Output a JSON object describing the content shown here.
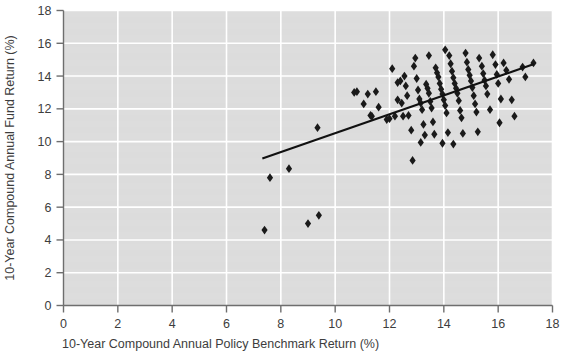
{
  "chart_data": {
    "type": "scatter",
    "title": "",
    "xlabel": "10-Year Compound Annual Policy Benchmark Return (%)",
    "ylabel": "10-Year Compound Annual Fund Return (%)",
    "xlim": [
      0,
      18
    ],
    "ylim": [
      0,
      18
    ],
    "xticks": [
      0,
      2,
      4,
      6,
      8,
      10,
      12,
      14,
      16,
      18
    ],
    "yticks": [
      0,
      2,
      4,
      6,
      8,
      10,
      12,
      14,
      16,
      18
    ],
    "grid": true,
    "legend": null,
    "marker": "diamond",
    "marker_color": "#1a1a1a",
    "plot_bg_color": "#dcdcdc",
    "grid_color": "#ffffff",
    "axis_color": "#6e6e6e",
    "trendline": {
      "label": "",
      "color": "#111111",
      "x": [
        7.32,
        17.32
      ],
      "y": [
        8.97,
        14.73
      ]
    },
    "points": [
      [
        7.4,
        4.6
      ],
      [
        7.6,
        7.8
      ],
      [
        8.3,
        8.35
      ],
      [
        9.0,
        5.0
      ],
      [
        9.4,
        5.5
      ],
      [
        9.35,
        10.85
      ],
      [
        10.7,
        13.0
      ],
      [
        10.8,
        13.05
      ],
      [
        11.2,
        12.9
      ],
      [
        11.3,
        11.6
      ],
      [
        11.35,
        11.55
      ],
      [
        11.6,
        12.1
      ],
      [
        11.9,
        11.35
      ],
      [
        12.0,
        11.4
      ],
      [
        12.2,
        11.55
      ],
      [
        12.3,
        13.6
      ],
      [
        12.4,
        13.7
      ],
      [
        12.3,
        12.55
      ],
      [
        12.45,
        12.35
      ],
      [
        12.5,
        11.55
      ],
      [
        12.55,
        14.0
      ],
      [
        12.6,
        13.4
      ],
      [
        12.65,
        12.8
      ],
      [
        12.7,
        11.6
      ],
      [
        12.8,
        10.7
      ],
      [
        12.85,
        8.85
      ],
      [
        12.9,
        14.6
      ],
      [
        13.0,
        13.85
      ],
      [
        13.05,
        13.15
      ],
      [
        13.1,
        12.6
      ],
      [
        13.15,
        12.35
      ],
      [
        13.2,
        11.95
      ],
      [
        13.25,
        11.05
      ],
      [
        13.3,
        10.4
      ],
      [
        13.35,
        13.5
      ],
      [
        13.4,
        13.25
      ],
      [
        13.45,
        12.95
      ],
      [
        13.5,
        12.45
      ],
      [
        13.55,
        12.05
      ],
      [
        13.6,
        11.2
      ],
      [
        13.65,
        10.45
      ],
      [
        13.7,
        14.5
      ],
      [
        13.75,
        14.2
      ],
      [
        13.8,
        13.95
      ],
      [
        13.85,
        13.55
      ],
      [
        13.9,
        13.2
      ],
      [
        13.95,
        12.9
      ],
      [
        14.0,
        12.55
      ],
      [
        14.05,
        12.2
      ],
      [
        14.1,
        11.75
      ],
      [
        14.15,
        10.55
      ],
      [
        14.2,
        15.25
      ],
      [
        14.25,
        14.75
      ],
      [
        14.3,
        14.3
      ],
      [
        14.35,
        13.9
      ],
      [
        14.4,
        13.55
      ],
      [
        14.45,
        13.25
      ],
      [
        14.5,
        12.95
      ],
      [
        14.55,
        12.5
      ],
      [
        14.6,
        11.9
      ],
      [
        14.65,
        11.45
      ],
      [
        14.7,
        10.5
      ],
      [
        14.8,
        15.4
      ],
      [
        14.85,
        14.85
      ],
      [
        14.9,
        14.4
      ],
      [
        14.95,
        14.05
      ],
      [
        15.0,
        13.7
      ],
      [
        15.05,
        13.3
      ],
      [
        15.1,
        12.8
      ],
      [
        15.15,
        12.3
      ],
      [
        15.2,
        11.8
      ],
      [
        15.3,
        15.1
      ],
      [
        15.4,
        14.6
      ],
      [
        15.45,
        14.15
      ],
      [
        15.5,
        13.75
      ],
      [
        15.55,
        13.4
      ],
      [
        15.6,
        12.9
      ],
      [
        15.7,
        11.95
      ],
      [
        15.8,
        15.3
      ],
      [
        15.9,
        14.7
      ],
      [
        15.95,
        14.1
      ],
      [
        16.0,
        13.55
      ],
      [
        16.1,
        12.6
      ],
      [
        16.2,
        14.8
      ],
      [
        16.3,
        14.35
      ],
      [
        16.4,
        13.8
      ],
      [
        16.5,
        12.55
      ],
      [
        16.6,
        11.55
      ],
      [
        16.9,
        14.55
      ],
      [
        17.0,
        13.95
      ],
      [
        17.3,
        14.8
      ],
      [
        12.1,
        14.45
      ],
      [
        12.95,
        15.1
      ],
      [
        13.45,
        15.25
      ],
      [
        14.05,
        15.6
      ],
      [
        11.05,
        12.3
      ],
      [
        11.5,
        13.05
      ],
      [
        13.15,
        9.95
      ],
      [
        13.95,
        9.9
      ],
      [
        14.35,
        9.85
      ],
      [
        15.25,
        10.6
      ],
      [
        16.05,
        11.15
      ]
    ]
  }
}
